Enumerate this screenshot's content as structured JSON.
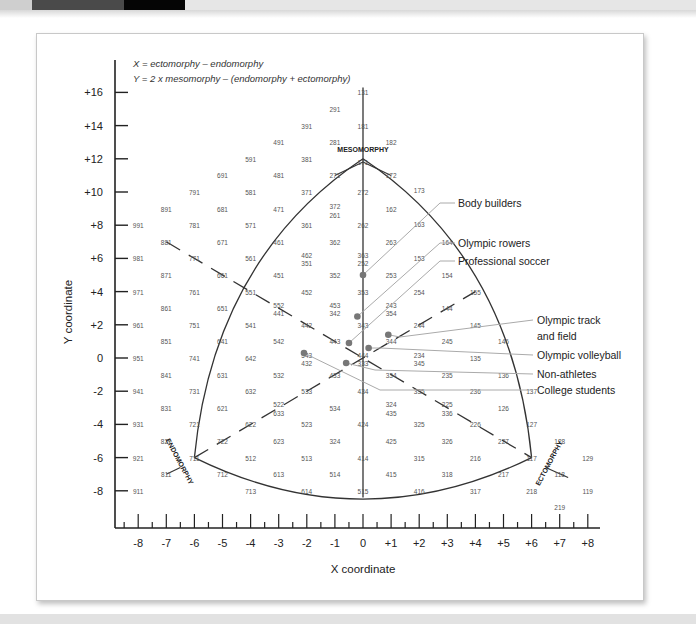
{
  "page": {
    "top_strip_colors": [
      "#cfcfcf",
      "#4a4a4a",
      "#050505",
      "#e6e6e6"
    ]
  },
  "chart_data": {
    "type": "scatter",
    "formula_lines": [
      "X = ectomorphy – endomorphy",
      "Y = 2 x mesomorphy – (endomorphy + ectomorphy)"
    ],
    "xlabel": "X coordinate",
    "ylabel": "Y coordinate",
    "xlim": [
      -8,
      8
    ],
    "ylim": [
      -8,
      16
    ],
    "grid": false,
    "x_ticks": [
      "-8",
      "-7",
      "-6",
      "-5",
      "-4",
      "-3",
      "-2",
      "-1",
      "0",
      "+1",
      "+2",
      "+3",
      "+4",
      "+5",
      "+6",
      "+7",
      "+8"
    ],
    "y_ticks": [
      "+16",
      "+14",
      "+12",
      "+10",
      "+8",
      "+6",
      "+4",
      "+2",
      "0",
      "-2",
      "-4",
      "-6",
      "-8"
    ],
    "region_labels": [
      {
        "text": "MESOMORPHY",
        "x": 0,
        "y": 12.4
      },
      {
        "text": "ENDOMORPHY",
        "x": -6.6,
        "y": -6.3,
        "rotate": 62
      },
      {
        "text": "ECTOMORPHY",
        "x": 6.7,
        "y": -6.4,
        "rotate": -62
      }
    ],
    "somatotype_grid": [
      {
        "t": "131",
        "x": 0,
        "y": 16
      },
      {
        "t": "291",
        "x": -1,
        "y": 15
      },
      {
        "t": "391",
        "x": -2,
        "y": 14
      },
      {
        "t": "181",
        "x": 0,
        "y": 14
      },
      {
        "t": "491",
        "x": -3,
        "y": 13
      },
      {
        "t": "281",
        "x": -1,
        "y": 13
      },
      {
        "t": "182",
        "x": 1,
        "y": 13
      },
      {
        "t": "591",
        "x": -4,
        "y": 12
      },
      {
        "t": "381",
        "x": -2,
        "y": 12
      },
      {
        "t": "171",
        "x": 0,
        "y": 11.8
      },
      {
        "t": "691",
        "x": -5,
        "y": 11
      },
      {
        "t": "481",
        "x": -3,
        "y": 11
      },
      {
        "t": "271",
        "x": -1,
        "y": 11
      },
      {
        "t": "172",
        "x": 1,
        "y": 11
      },
      {
        "t": "791",
        "x": -6,
        "y": 10
      },
      {
        "t": "581",
        "x": -4,
        "y": 10
      },
      {
        "t": "371",
        "x": -2,
        "y": 10
      },
      {
        "t": "272",
        "x": 0,
        "y": 10
      },
      {
        "t": "173",
        "x": 2,
        "y": 10.1
      },
      {
        "t": "891",
        "x": -7,
        "y": 9
      },
      {
        "t": "681",
        "x": -5,
        "y": 9
      },
      {
        "t": "471",
        "x": -3,
        "y": 9
      },
      {
        "t": "372",
        "x": -1,
        "y": 9.15
      },
      {
        "t": "261",
        "x": -1,
        "y": 8.6
      },
      {
        "t": "162",
        "x": 1,
        "y": 9
      },
      {
        "t": "991",
        "x": -8,
        "y": 8
      },
      {
        "t": "781",
        "x": -6,
        "y": 8
      },
      {
        "t": "571",
        "x": -4,
        "y": 8
      },
      {
        "t": "361",
        "x": -2,
        "y": 8
      },
      {
        "t": "262",
        "x": 0,
        "y": 8
      },
      {
        "t": "163",
        "x": 2,
        "y": 8.1
      },
      {
        "t": "881",
        "x": -7,
        "y": 7
      },
      {
        "t": "671",
        "x": -5,
        "y": 7
      },
      {
        "t": "461",
        "x": -3,
        "y": 7
      },
      {
        "t": "362",
        "x": -1,
        "y": 7
      },
      {
        "t": "263",
        "x": 1,
        "y": 7
      },
      {
        "t": "164",
        "x": 3,
        "y": 7
      },
      {
        "t": "981",
        "x": -8,
        "y": 6
      },
      {
        "t": "771",
        "x": -6,
        "y": 6
      },
      {
        "t": "561",
        "x": -4,
        "y": 6
      },
      {
        "t": "462",
        "x": -2,
        "y": 6.2
      },
      {
        "t": "351",
        "x": -2,
        "y": 5.7
      },
      {
        "t": "363",
        "x": 0,
        "y": 6.2
      },
      {
        "t": "252",
        "x": 0,
        "y": 5.7
      },
      {
        "t": "153",
        "x": 2,
        "y": 6
      },
      {
        "t": "871",
        "x": -7,
        "y": 5
      },
      {
        "t": "661",
        "x": -5,
        "y": 5
      },
      {
        "t": "451",
        "x": -3,
        "y": 5
      },
      {
        "t": "352",
        "x": -1,
        "y": 5
      },
      {
        "t": "253",
        "x": 1,
        "y": 5
      },
      {
        "t": "154",
        "x": 3,
        "y": 5
      },
      {
        "t": "971",
        "x": -8,
        "y": 4
      },
      {
        "t": "761",
        "x": -6,
        "y": 4
      },
      {
        "t": "551",
        "x": -4,
        "y": 4
      },
      {
        "t": "452",
        "x": -2,
        "y": 4
      },
      {
        "t": "353",
        "x": 0,
        "y": 4
      },
      {
        "t": "254",
        "x": 2,
        "y": 4
      },
      {
        "t": "155",
        "x": 4,
        "y": 4
      },
      {
        "t": "861",
        "x": -7,
        "y": 3
      },
      {
        "t": "651",
        "x": -5,
        "y": 3
      },
      {
        "t": "552",
        "x": -3,
        "y": 3.2
      },
      {
        "t": "441",
        "x": -3,
        "y": 2.7
      },
      {
        "t": "453",
        "x": -1,
        "y": 3.2
      },
      {
        "t": "342",
        "x": -1,
        "y": 2.7
      },
      {
        "t": "243",
        "x": 1,
        "y": 3.2
      },
      {
        "t": "354",
        "x": 1,
        "y": 2.7
      },
      {
        "t": "144",
        "x": 3,
        "y": 3
      },
      {
        "t": "961",
        "x": -8,
        "y": 2
      },
      {
        "t": "751",
        "x": -6,
        "y": 2
      },
      {
        "t": "541",
        "x": -4,
        "y": 2
      },
      {
        "t": "442",
        "x": -2,
        "y": 2
      },
      {
        "t": "343",
        "x": 0,
        "y": 2
      },
      {
        "t": "244",
        "x": 2,
        "y": 2
      },
      {
        "t": "145",
        "x": 4,
        "y": 2
      },
      {
        "t": "851",
        "x": -7,
        "y": 1
      },
      {
        "t": "641",
        "x": -5,
        "y": 1
      },
      {
        "t": "542",
        "x": -3,
        "y": 1
      },
      {
        "t": "443",
        "x": -1,
        "y": 1
      },
      {
        "t": "344",
        "x": 1,
        "y": 1
      },
      {
        "t": "245",
        "x": 3,
        "y": 1
      },
      {
        "t": "146",
        "x": 5,
        "y": 1
      },
      {
        "t": "951",
        "x": -8,
        "y": 0
      },
      {
        "t": "741",
        "x": -6,
        "y": 0
      },
      {
        "t": "642",
        "x": -4,
        "y": 0
      },
      {
        "t": "543",
        "x": -2,
        "y": 0.2
      },
      {
        "t": "432",
        "x": -2,
        "y": -0.3
      },
      {
        "t": "444",
        "x": 0,
        "y": 0.2
      },
      {
        "t": "333",
        "x": 0,
        "y": -0.3
      },
      {
        "t": "234",
        "x": 2,
        "y": 0.2
      },
      {
        "t": "345",
        "x": 2,
        "y": -0.3
      },
      {
        "t": "135",
        "x": 4,
        "y": 0
      },
      {
        "t": "841",
        "x": -7,
        "y": -1
      },
      {
        "t": "631",
        "x": -5,
        "y": -1
      },
      {
        "t": "532",
        "x": -3,
        "y": -1
      },
      {
        "t": "433",
        "x": -1,
        "y": -1
      },
      {
        "t": "334",
        "x": 1,
        "y": -1
      },
      {
        "t": "235",
        "x": 3,
        "y": -1
      },
      {
        "t": "136",
        "x": 5,
        "y": -1
      },
      {
        "t": "941",
        "x": -8,
        "y": -2
      },
      {
        "t": "731",
        "x": -6,
        "y": -2
      },
      {
        "t": "632",
        "x": -4,
        "y": -2
      },
      {
        "t": "533",
        "x": -2,
        "y": -2
      },
      {
        "t": "434",
        "x": 0,
        "y": -2
      },
      {
        "t": "335",
        "x": 2,
        "y": -2
      },
      {
        "t": "236",
        "x": 4,
        "y": -2
      },
      {
        "t": "137",
        "x": 6,
        "y": -2
      },
      {
        "t": "831",
        "x": -7,
        "y": -3
      },
      {
        "t": "621",
        "x": -5,
        "y": -3
      },
      {
        "t": "522",
        "x": -3,
        "y": -2.8
      },
      {
        "t": "633",
        "x": -3,
        "y": -3.3
      },
      {
        "t": "534",
        "x": -1,
        "y": -3
      },
      {
        "t": "324",
        "x": 1,
        "y": -2.8
      },
      {
        "t": "435",
        "x": 1,
        "y": -3.3
      },
      {
        "t": "225",
        "x": 3,
        "y": -2.8
      },
      {
        "t": "336",
        "x": 3,
        "y": -3.3
      },
      {
        "t": "126",
        "x": 5,
        "y": -3
      },
      {
        "t": "931",
        "x": -8,
        "y": -4
      },
      {
        "t": "721",
        "x": -6,
        "y": -4
      },
      {
        "t": "622",
        "x": -4,
        "y": -4
      },
      {
        "t": "523",
        "x": -2,
        "y": -4
      },
      {
        "t": "424",
        "x": 0,
        "y": -4
      },
      {
        "t": "325",
        "x": 2,
        "y": -4
      },
      {
        "t": "226",
        "x": 4,
        "y": -4
      },
      {
        "t": "127",
        "x": 6,
        "y": -4
      },
      {
        "t": "821",
        "x": -7,
        "y": -5
      },
      {
        "t": "722",
        "x": -5,
        "y": -5
      },
      {
        "t": "623",
        "x": -3,
        "y": -5
      },
      {
        "t": "324",
        "x": -1,
        "y": -5
      },
      {
        "t": "425",
        "x": 1,
        "y": -5
      },
      {
        "t": "326",
        "x": 3,
        "y": -5
      },
      {
        "t": "227",
        "x": 5,
        "y": -5
      },
      {
        "t": "128",
        "x": 7,
        "y": -5
      },
      {
        "t": "921",
        "x": -8,
        "y": -6
      },
      {
        "t": "711",
        "x": -6,
        "y": -6
      },
      {
        "t": "512",
        "x": -4,
        "y": -6
      },
      {
        "t": "513",
        "x": -2,
        "y": -6
      },
      {
        "t": "414",
        "x": 0,
        "y": -6
      },
      {
        "t": "315",
        "x": 2,
        "y": -6
      },
      {
        "t": "216",
        "x": 4,
        "y": -6
      },
      {
        "t": "117",
        "x": 6,
        "y": -6
      },
      {
        "t": "129",
        "x": 8,
        "y": -6
      },
      {
        "t": "811",
        "x": -7,
        "y": -7
      },
      {
        "t": "712",
        "x": -5,
        "y": -7
      },
      {
        "t": "613",
        "x": -3,
        "y": -7
      },
      {
        "t": "514",
        "x": -1,
        "y": -7
      },
      {
        "t": "415",
        "x": 1,
        "y": -7
      },
      {
        "t": "318",
        "x": 3,
        "y": -7
      },
      {
        "t": "217",
        "x": 5,
        "y": -7
      },
      {
        "t": "118",
        "x": 7,
        "y": -7
      },
      {
        "t": "911",
        "x": -8,
        "y": -8
      },
      {
        "t": "713",
        "x": -4,
        "y": -8
      },
      {
        "t": "614",
        "x": -2,
        "y": -8
      },
      {
        "t": "515",
        "x": 0,
        "y": -8
      },
      {
        "t": "416",
        "x": 2,
        "y": -8
      },
      {
        "t": "317",
        "x": 4,
        "y": -8
      },
      {
        "t": "218",
        "x": 6,
        "y": -8
      },
      {
        "t": "119",
        "x": 8,
        "y": -8
      },
      {
        "t": "219",
        "x": 7,
        "y": -9
      }
    ],
    "series": [
      {
        "name": "Body builders",
        "x": 0.0,
        "y": 5.0
      },
      {
        "name": "Olympic rowers",
        "x": -0.2,
        "y": 2.5
      },
      {
        "name": "Professional soccer",
        "x": -0.5,
        "y": 0.9
      },
      {
        "name": "Olympic track and field",
        "x": 0.9,
        "y": 1.4
      },
      {
        "name": "Olympic volleyball",
        "x": 0.2,
        "y": 0.6
      },
      {
        "name": "Non-athletes",
        "x": -0.6,
        "y": -0.3
      },
      {
        "name": "College students",
        "x": -2.1,
        "y": 0.3
      }
    ],
    "callout_labels": [
      {
        "text": "Body builders",
        "lx": 458,
        "ly": 203
      },
      {
        "text": "Olympic rowers",
        "lx": 458,
        "ly": 243
      },
      {
        "text": "Professional soccer",
        "lx": 458,
        "ly": 261
      },
      {
        "text": "Olympic track",
        "lx": 537,
        "ly": 320
      },
      {
        "text": "and field",
        "lx": 537,
        "ly": 336
      },
      {
        "text": "Olympic volleyball",
        "lx": 537,
        "ly": 355
      },
      {
        "text": "Non-athletes",
        "lx": 537,
        "ly": 374
      },
      {
        "text": "College students",
        "lx": 537,
        "ly": 390
      }
    ]
  }
}
